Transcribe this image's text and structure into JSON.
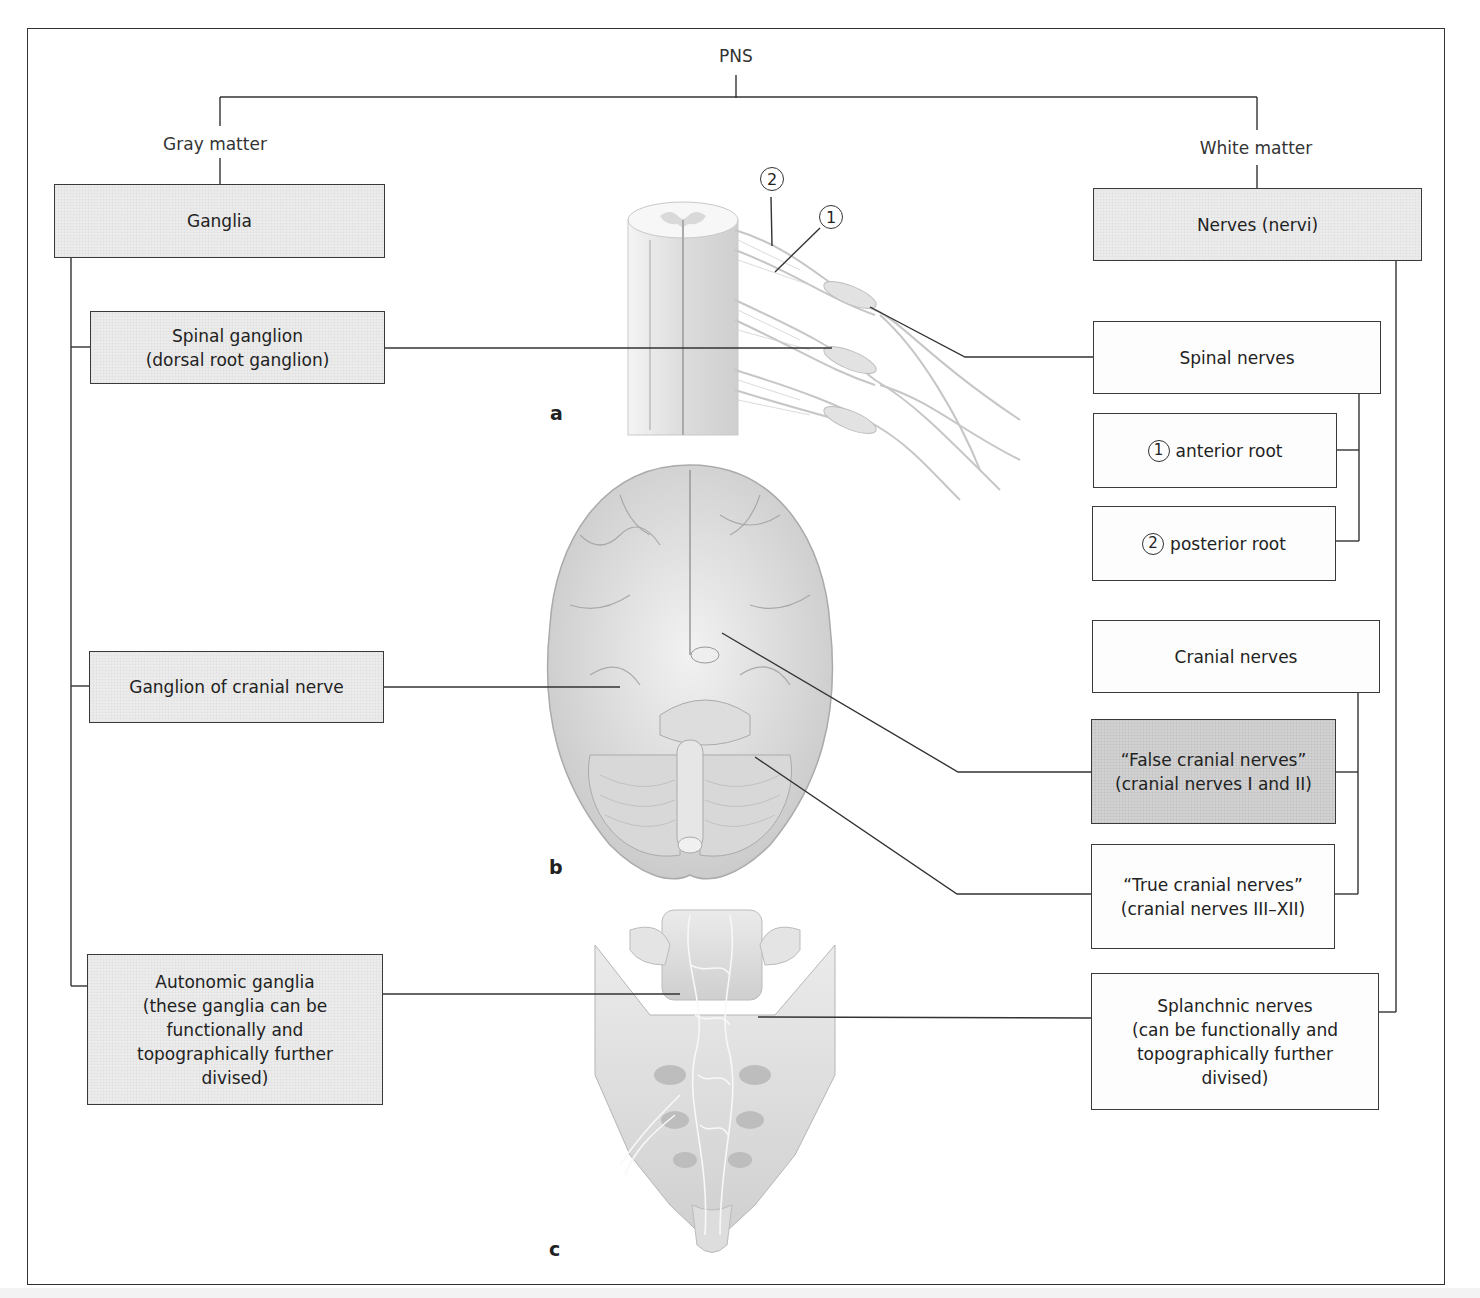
{
  "diagram": {
    "root": "PNS",
    "branches": {
      "gray_matter": {
        "label": "Gray matter",
        "main_box": "Ganglia",
        "children": [
          {
            "id": "spinal-ganglion",
            "text": "Spinal ganglion\n(dorsal root ganglion)"
          },
          {
            "id": "ganglion-cranial",
            "text": "Ganglion of cranial nerve"
          },
          {
            "id": "autonomic-ganglia",
            "text": "Autonomic ganglia\n(these ganglia can be\nfunctionally and\ntopographically further\ndivised)"
          }
        ]
      },
      "white_matter": {
        "label": "White matter",
        "main_box": "Nerves (nervi)",
        "children": [
          {
            "id": "spinal-nerves",
            "text": "Spinal nerves",
            "sub": [
              {
                "marker": "1",
                "text": "anterior root"
              },
              {
                "marker": "2",
                "text": "posterior root"
              }
            ]
          },
          {
            "id": "cranial-nerves",
            "text": "Cranial nerves",
            "sub": [
              {
                "text": "“False cranial nerves”\n(cranial nerves I and II)"
              },
              {
                "text": "“True cranial nerves”\n(cranial nerves  III–XII)"
              }
            ]
          },
          {
            "id": "splanchnic-nerves",
            "text": "Splanchnic nerves\n(can be functionally and\ntopographically further\ndivised)"
          }
        ]
      }
    },
    "figures": [
      {
        "letter": "a",
        "subject": "spinal-cord-with-roots-illustration",
        "markers": [
          "1",
          "2"
        ]
      },
      {
        "letter": "b",
        "subject": "brain-inferior-view-illustration"
      },
      {
        "letter": "c",
        "subject": "sacrum-autonomic-plexus-illustration"
      }
    ],
    "colors": {
      "line": "#333333",
      "box_gray": "#ececec",
      "box_dark": "#d2d2d2",
      "box_white": "#fdfdfd"
    }
  }
}
